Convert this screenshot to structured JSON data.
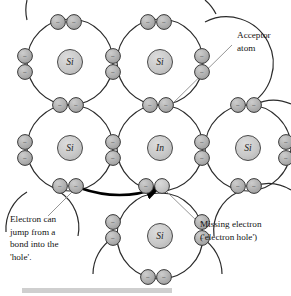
{
  "figure": {
    "background_color": "#ffffff",
    "line_color": "#2b2b2b",
    "atom_fill": "#c9c9c9",
    "electron_fill": "#b0b0b0",
    "hole_fill": "#cfcfcf",
    "pointer_color": "#8a8a8a",
    "arrow_color": "#000000"
  },
  "atoms": [
    {
      "id": "si-top-left",
      "label": "Si",
      "cx": 70,
      "cy": 62,
      "r": 43
    },
    {
      "id": "si-top-mid",
      "label": "Si",
      "cx": 160,
      "cy": 62,
      "r": 43
    },
    {
      "id": "si-mid-left",
      "label": "Si",
      "cx": 70,
      "cy": 148,
      "r": 43
    },
    {
      "id": "in-center",
      "label": "In",
      "cx": 160,
      "cy": 148,
      "r": 43
    },
    {
      "id": "si-mid-right",
      "label": "Si",
      "cx": 248,
      "cy": 148,
      "r": 43
    },
    {
      "id": "si-bottom-mid",
      "label": "Si",
      "cx": 160,
      "cy": 236,
      "r": 43
    }
  ],
  "electron_symbol": "−",
  "electrons": [
    {
      "id": "e-top-left-a",
      "cx": 58,
      "cy": 22,
      "state": "present"
    },
    {
      "id": "e-top-left-b",
      "cx": 74,
      "cy": 22,
      "state": "present"
    },
    {
      "id": "e-top-mid-a",
      "cx": 148,
      "cy": 22,
      "state": "present"
    },
    {
      "id": "e-top-mid-b",
      "cx": 164,
      "cy": 22,
      "state": "present"
    },
    {
      "id": "e-left-upper-a",
      "cx": 25,
      "cy": 56,
      "state": "present"
    },
    {
      "id": "e-left-upper-b",
      "cx": 25,
      "cy": 72,
      "state": "present"
    },
    {
      "id": "e-mid-upper-a",
      "cx": 113,
      "cy": 56,
      "state": "present"
    },
    {
      "id": "e-mid-upper-b",
      "cx": 113,
      "cy": 72,
      "state": "present"
    },
    {
      "id": "e-right-upper-a",
      "cx": 202,
      "cy": 56,
      "state": "present"
    },
    {
      "id": "e-right-upper-b",
      "cx": 202,
      "cy": 72,
      "state": "present"
    },
    {
      "id": "e-row1-l-a",
      "cx": 60,
      "cy": 105,
      "state": "present"
    },
    {
      "id": "e-row1-l-b",
      "cx": 76,
      "cy": 105,
      "state": "present"
    },
    {
      "id": "e-row1-m-a",
      "cx": 150,
      "cy": 105,
      "state": "present"
    },
    {
      "id": "e-row1-m-b",
      "cx": 166,
      "cy": 105,
      "state": "present"
    },
    {
      "id": "e-row1-r-a",
      "cx": 238,
      "cy": 105,
      "state": "present"
    },
    {
      "id": "e-row1-r-b",
      "cx": 254,
      "cy": 105,
      "state": "present"
    },
    {
      "id": "e-far-left-a",
      "cx": 25,
      "cy": 142,
      "state": "present"
    },
    {
      "id": "e-far-left-b",
      "cx": 25,
      "cy": 158,
      "state": "present"
    },
    {
      "id": "e-mid-left-a",
      "cx": 113,
      "cy": 142,
      "state": "present"
    },
    {
      "id": "e-mid-left-b",
      "cx": 113,
      "cy": 158,
      "state": "present"
    },
    {
      "id": "e-mid-right-a",
      "cx": 202,
      "cy": 142,
      "state": "present"
    },
    {
      "id": "e-mid-right-b",
      "cx": 202,
      "cy": 158,
      "state": "present"
    },
    {
      "id": "e-far-right-a",
      "cx": 286,
      "cy": 142,
      "state": "present"
    },
    {
      "id": "e-far-right-b",
      "cx": 286,
      "cy": 158,
      "state": "present"
    },
    {
      "id": "e-row2-l-a",
      "cx": 60,
      "cy": 186,
      "state": "present"
    },
    {
      "id": "e-row2-l-b",
      "cx": 76,
      "cy": 186,
      "state": "present"
    },
    {
      "id": "e-row2-m-a",
      "cx": 146,
      "cy": 186,
      "state": "present"
    },
    {
      "id": "e-row2-m-b",
      "cx": 162,
      "cy": 186,
      "state": "hole"
    },
    {
      "id": "e-row2-r-a",
      "cx": 238,
      "cy": 186,
      "state": "present"
    },
    {
      "id": "e-row2-r-b",
      "cx": 254,
      "cy": 186,
      "state": "present"
    },
    {
      "id": "e-bot-left-a",
      "cx": 113,
      "cy": 222,
      "state": "present"
    },
    {
      "id": "e-bot-left-b",
      "cx": 113,
      "cy": 238,
      "state": "present"
    },
    {
      "id": "e-bot-right-a",
      "cx": 202,
      "cy": 222,
      "state": "present"
    },
    {
      "id": "e-bot-right-b",
      "cx": 202,
      "cy": 238,
      "state": "present"
    },
    {
      "id": "e-bottom-a",
      "cx": 148,
      "cy": 277,
      "state": "present"
    },
    {
      "id": "e-bottom-b",
      "cx": 164,
      "cy": 277,
      "state": "present"
    }
  ],
  "annotations": {
    "acceptor": {
      "id": "acceptor-atom-label",
      "lines": [
        "Acceptor",
        "atom"
      ],
      "x": 237,
      "y": 38,
      "leader": {
        "x1": 232,
        "y1": 45,
        "x2": 166,
        "y2": 110
      }
    },
    "electron_jump": {
      "id": "electron-jump-label",
      "lines": [
        "Electron can",
        "jump from a",
        "bond into the",
        "'hole'."
      ],
      "x": 10,
      "y": 222,
      "leader": {
        "x1": 48,
        "y1": 216,
        "x2": 72,
        "y2": 192
      }
    },
    "missing_electron": {
      "id": "missing-electron-label",
      "lines": [
        "Missing electron",
        "('electron hole')"
      ],
      "x": 200,
      "y": 227,
      "leader": {
        "x1": 198,
        "y1": 222,
        "x2": 166,
        "y2": 191
      }
    }
  },
  "arrow": {
    "id": "electron-jump-arrow",
    "path": "M 80 188 Q 120 202 158 188",
    "description": "curved arrow from bond electron into the hole"
  }
}
